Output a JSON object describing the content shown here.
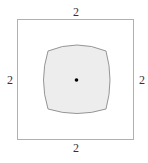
{
  "diagram": {
    "title": "",
    "outer_square": {
      "side_labels": {
        "top": "2",
        "bottom": "2",
        "left": "2",
        "right": "2"
      },
      "stroke_color": "#b0b0b0",
      "fill_color": "#ffffff"
    },
    "inner_shape": {
      "description": "square with slightly convex (bulging) sides",
      "fill_color": "#ededed",
      "stroke_color": "#8a8a8a"
    },
    "center_point": {
      "color": "#000000"
    }
  }
}
